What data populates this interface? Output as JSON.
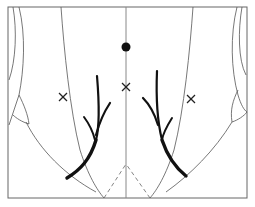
{
  "diagram": {
    "type": "anatomical-line-drawing",
    "frame": {
      "x": 8,
      "y": 7,
      "width": 239,
      "height": 191
    },
    "colors": {
      "background": "#ffffff",
      "thin_lines": "#555555",
      "midline": "#888888",
      "thick_strokes": "#111111",
      "markers": "#222222"
    },
    "markers": [
      {
        "kind": "dot",
        "x": 126,
        "y": 47
      },
      {
        "kind": "cross",
        "x": 126,
        "y": 87
      },
      {
        "kind": "cross",
        "x": 63,
        "y": 97
      },
      {
        "kind": "cross",
        "x": 191,
        "y": 99
      }
    ]
  }
}
